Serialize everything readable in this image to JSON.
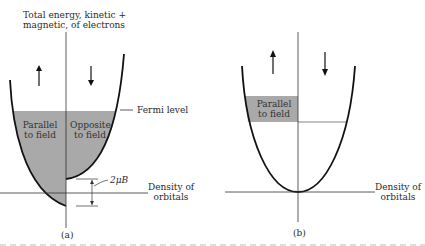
{
  "figure_a": {
    "y_axis_label_line1": "Total energy, kinetic +",
    "y_axis_label_line2": "magnetic, of electrons",
    "left_region_line1": "Parallel",
    "left_region_line2": "to field",
    "right_region_line1": "Opposite",
    "right_region_line2": "to field",
    "fermi_label": "Fermi level",
    "splitting_label": "2μB",
    "x_axis_label_line1": "Density of",
    "x_axis_label_line2": "orbitals",
    "caption": "(a)",
    "left_arrow": "up-arrow",
    "right_arrow": "down-arrow"
  },
  "figure_b": {
    "region_line1": "Parallel",
    "region_line2": "to field",
    "x_axis_label_line1": "Density of",
    "x_axis_label_line2": "orbitals",
    "caption": "(b)",
    "left_arrow": "up-arrow",
    "right_arrow": "down-arrow"
  },
  "colors": {
    "shade": "#a9a9a9",
    "line": "#111111",
    "axis": "#333333"
  }
}
